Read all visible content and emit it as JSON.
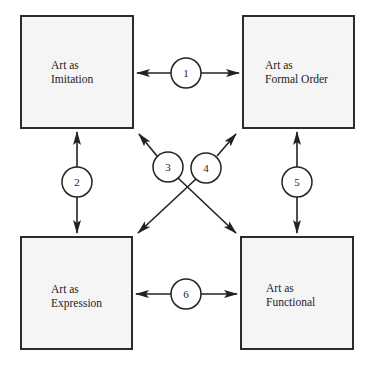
{
  "diagram": {
    "boxes": [
      {
        "id": "imitation",
        "line1": "Art as",
        "line2": "Imitation"
      },
      {
        "id": "formal-order",
        "line1": "Art as",
        "line2": "Formal Order"
      },
      {
        "id": "expression",
        "line1": "Art as",
        "line2": "Expression"
      },
      {
        "id": "functional",
        "line1": "Art as",
        "line2": "Functional"
      }
    ],
    "connectors": [
      {
        "label": "1",
        "from": "imitation",
        "to": "formal-order"
      },
      {
        "label": "2",
        "from": "imitation",
        "to": "expression"
      },
      {
        "label": "3",
        "from": "imitation",
        "to": "functional"
      },
      {
        "label": "4",
        "from": "formal-order",
        "to": "expression"
      },
      {
        "label": "5",
        "from": "formal-order",
        "to": "functional"
      },
      {
        "label": "6",
        "from": "expression",
        "to": "functional"
      }
    ]
  }
}
